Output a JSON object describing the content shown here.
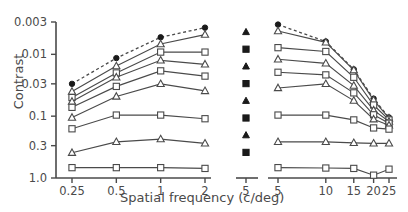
{
  "chart_data": {
    "type": "line",
    "title": "",
    "xlabel": "Spatial frequency (c/deg)",
    "ylabel": "Contrast",
    "y_scale": "log-inverted",
    "x_scale": "log-split",
    "ylim": [
      0.003,
      1.0
    ],
    "y_ticks": [
      0.003,
      0.01,
      0.03,
      0.1,
      0.3,
      1.0
    ],
    "y_tick_labels": [
      "0.003",
      "0.01",
      "0.03",
      "0.1",
      "0.3",
      "1.0"
    ],
    "grid": false,
    "legend_position": "none",
    "panels": [
      {
        "name": "low-frequency-panel",
        "x_ticks": [
          0.25,
          0.5,
          1,
          2
        ],
        "x_tick_labels": [
          "0.25",
          "0.5",
          "1",
          "2"
        ],
        "xlim": [
          0.25,
          2
        ]
      },
      {
        "name": "symbol-key-column",
        "x_ticks": [
          5
        ],
        "x_tick_labels": [
          "5"
        ],
        "symbols": [
          "triangle-filled",
          "square-filled",
          "triangle-filled",
          "square-filled",
          "triangle-filled",
          "square-filled",
          "triangle-filled",
          "square-filled"
        ]
      },
      {
        "name": "high-frequency-panel",
        "x_ticks": [
          5,
          10,
          15,
          20,
          25
        ],
        "x_tick_labels": [
          "5",
          "10",
          "15",
          "20",
          "25"
        ],
        "xlim": [
          5,
          25
        ]
      }
    ],
    "series": [
      {
        "name": "series-1",
        "marker": "circle-filled",
        "line_style": "dashed",
        "left_x": [
          0.25,
          0.5,
          1,
          2
        ],
        "left_values": [
          0.03,
          0.0115,
          0.0053,
          0.0037
        ],
        "right_x": [
          5,
          10,
          15,
          20,
          25
        ],
        "right_values": [
          0.0033,
          0.0062,
          0.0175,
          0.052,
          0.105
        ]
      },
      {
        "name": "series-2",
        "marker": "triangle-open",
        "line_style": "solid",
        "left_x": [
          0.25,
          0.5,
          1,
          2
        ],
        "left_values": [
          0.04,
          0.0155,
          0.0068,
          0.0048
        ],
        "right_x": [
          5,
          10,
          15,
          20,
          25
        ],
        "right_values": [
          0.0042,
          0.0064,
          0.018,
          0.055,
          0.108
        ]
      },
      {
        "name": "series-3",
        "marker": "square-open",
        "line_style": "solid",
        "left_x": [
          0.25,
          0.5,
          1,
          2
        ],
        "left_values": [
          0.05,
          0.02,
          0.0092,
          0.0092
        ],
        "right_x": [
          5,
          10,
          15,
          20,
          25
        ],
        "right_values": [
          0.0078,
          0.009,
          0.0235,
          0.066,
          0.115
        ]
      },
      {
        "name": "series-4",
        "marker": "triangle-open",
        "line_style": "solid",
        "left_x": [
          0.25,
          0.5,
          1,
          2
        ],
        "left_values": [
          0.058,
          0.0235,
          0.0125,
          0.0145
        ],
        "right_x": [
          5,
          10,
          15,
          20,
          25
        ],
        "right_values": [
          0.012,
          0.014,
          0.032,
          0.08,
          0.122
        ]
      },
      {
        "name": "series-5",
        "marker": "square-open",
        "line_style": "solid",
        "left_x": [
          0.25,
          0.5,
          1,
          2
        ],
        "left_values": [
          0.072,
          0.033,
          0.0185,
          0.0225
        ],
        "right_x": [
          5,
          10,
          15,
          20,
          25
        ],
        "right_values": [
          0.0195,
          0.0215,
          0.042,
          0.095,
          0.13
        ]
      },
      {
        "name": "series-6",
        "marker": "triangle-open",
        "line_style": "solid",
        "left_x": [
          0.25,
          0.5,
          1,
          2
        ],
        "left_values": [
          0.105,
          0.048,
          0.03,
          0.039
        ],
        "right_x": [
          5,
          10,
          15,
          20,
          25
        ],
        "right_values": [
          0.035,
          0.03,
          0.056,
          0.112,
          0.14
        ]
      },
      {
        "name": "series-7",
        "marker": "square-open",
        "line_style": "solid",
        "left_x": [
          0.25,
          0.5,
          1,
          2
        ],
        "left_values": [
          0.16,
          0.096,
          0.096,
          0.11
        ],
        "right_x": [
          5,
          10,
          15,
          20,
          25
        ],
        "right_values": [
          0.096,
          0.096,
          0.115,
          0.155,
          0.162
        ]
      },
      {
        "name": "series-8",
        "marker": "triangle-open",
        "line_style": "solid",
        "left_x": [
          0.25,
          0.5,
          1,
          2
        ],
        "left_values": [
          0.39,
          0.26,
          0.235,
          0.275
        ],
        "right_x": [
          5,
          10,
          15,
          20,
          25
        ],
        "right_values": [
          0.26,
          0.26,
          0.27,
          0.275,
          0.275
        ]
      },
      {
        "name": "series-9",
        "marker": "square-open",
        "line_style": "solid",
        "left_x": [
          0.25,
          0.5,
          1,
          2
        ],
        "left_values": [
          0.68,
          0.68,
          0.68,
          0.7
        ],
        "right_x": [
          5,
          10,
          15,
          20,
          25
        ],
        "right_values": [
          0.68,
          0.69,
          0.7,
          0.9,
          0.72
        ]
      }
    ]
  }
}
